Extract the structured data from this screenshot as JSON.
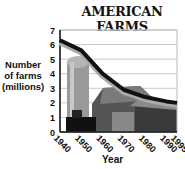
{
  "chart_data": {
    "type": "line",
    "title": "AMERICAN FARMS",
    "xlabel": "Year",
    "ylabel": "Number of farms (millions)",
    "categories": [
      "1940",
      "1950",
      "1960",
      "1970",
      "1980",
      "1990",
      "1995"
    ],
    "series": [
      {
        "name": "Number of farms (millions)",
        "values": [
          6.3,
          5.6,
          4.0,
          2.9,
          2.4,
          2.1,
          2.0
        ]
      }
    ],
    "y_ticks": [
      "0",
      "1",
      "2",
      "3",
      "4",
      "5",
      "6",
      "7"
    ],
    "ylim": [
      0,
      7
    ],
    "grid": true,
    "legend": "none",
    "annotations": [
      "background illustration: silo, barn, tractor"
    ]
  },
  "labels": {
    "title": "AMERICAN FARMS",
    "ylabel_line1": "Number",
    "ylabel_line2": "of farms",
    "ylabel_line3": "(millions)",
    "xlabel": "Year"
  }
}
